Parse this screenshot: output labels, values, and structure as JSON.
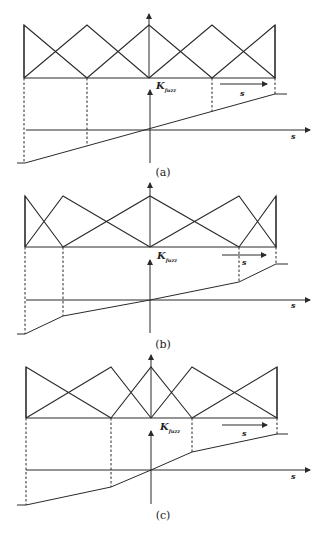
{
  "figure": {
    "panels": [
      {
        "caption": "(a)",
        "mf_top_y": 25,
        "mf_base_y": 78,
        "mf_up_arrow_tip_y": 14,
        "mf_peaks_x": [
          24,
          87,
          149,
          212,
          275
        ],
        "k_axis": {
          "x": 150,
          "top_y": 90,
          "bottom_y": 163,
          "label": "K",
          "label_sub": "fuzz",
          "label_x": 156,
          "label_y": 80
        },
        "s_axis": {
          "y": 130,
          "x_start": 26,
          "x_end": 310,
          "label": "s",
          "label_x": 291,
          "label_y": 131
        },
        "s_arrow": {
          "x1": 220,
          "x2": 267,
          "y": 84,
          "label": "s",
          "label_x": 240,
          "label_y": 88
        },
        "curve": [
          [
            17,
            163
          ],
          [
            25,
            163
          ],
          [
            275,
            94
          ],
          [
            287,
            94
          ]
        ],
        "dashed": [
          [
            24,
            78,
            163
          ],
          [
            87,
            78,
            146
          ],
          [
            212,
            78,
            111
          ],
          [
            275,
            78,
            94
          ]
        ],
        "caption_x": 163,
        "caption_y": 166
      },
      {
        "caption": "(b)",
        "mf_top_y": 196,
        "mf_base_y": 247,
        "mf_up_arrow_tip_y": 183,
        "mf_peaks_x": [
          25,
          63,
          150,
          239,
          276
        ],
        "k_axis": {
          "x": 150,
          "top_y": 260,
          "bottom_y": 333,
          "label": "K",
          "label_sub": "fuzz",
          "label_x": 157,
          "label_y": 250
        },
        "s_axis": {
          "y": 300,
          "x_start": 26,
          "x_end": 310,
          "label": "s",
          "label_x": 291,
          "label_y": 300
        },
        "s_arrow": {
          "x1": 222,
          "x2": 266,
          "y": 255,
          "label": "s",
          "label_x": 242,
          "label_y": 257
        },
        "curve": [
          [
            17,
            334
          ],
          [
            25,
            334
          ],
          [
            63,
            316
          ],
          [
            150,
            300
          ],
          [
            239,
            282
          ],
          [
            276,
            264
          ],
          [
            288,
            264
          ]
        ],
        "dashed": [
          [
            25,
            247,
            334
          ],
          [
            63,
            247,
            316
          ],
          [
            239,
            247,
            282
          ],
          [
            276,
            247,
            264
          ]
        ],
        "caption_x": 163,
        "caption_y": 338
      },
      {
        "caption": "(c)",
        "mf_top_y": 367,
        "mf_base_y": 418,
        "mf_up_arrow_tip_y": 355,
        "mf_peaks_x": [
          26,
          111,
          151,
          192,
          277
        ],
        "k_axis": {
          "x": 151,
          "top_y": 431,
          "bottom_y": 504,
          "label": "K",
          "label_sub": "fuzz",
          "label_x": 160,
          "label_y": 421
        },
        "s_axis": {
          "y": 470,
          "x_start": 26,
          "x_end": 310,
          "label": "s",
          "label_x": 291,
          "label_y": 471
        },
        "s_arrow": {
          "x1": 222,
          "x2": 267,
          "y": 425,
          "label": "s",
          "label_x": 242,
          "label_y": 428
        },
        "curve": [
          [
            17,
            505
          ],
          [
            26,
            505
          ],
          [
            111,
            487
          ],
          [
            151,
            470
          ],
          [
            192,
            452
          ],
          [
            277,
            434
          ],
          [
            288,
            434
          ]
        ],
        "dashed": [
          [
            26,
            418,
            505
          ],
          [
            111,
            418,
            487
          ],
          [
            192,
            418,
            452
          ],
          [
            277,
            418,
            434
          ]
        ],
        "caption_x": 163,
        "caption_y": 509
      }
    ]
  }
}
